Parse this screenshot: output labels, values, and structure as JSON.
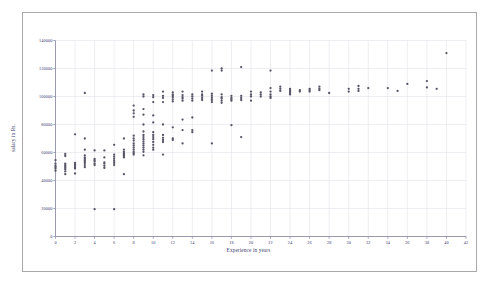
{
  "chart_data": {
    "type": "scatter",
    "title": "",
    "xlabel": "Experience in years",
    "ylabel": "salary in Rs.",
    "xlim": [
      0,
      42
    ],
    "ylim": [
      0,
      140000
    ],
    "xticks": [
      0,
      2,
      4,
      6,
      8,
      10,
      12,
      14,
      16,
      18,
      20,
      22,
      24,
      26,
      28,
      30,
      32,
      34,
      36,
      38,
      40,
      42
    ],
    "yticks": [
      0,
      20000,
      40000,
      60000,
      80000,
      100000,
      120000,
      140000
    ],
    "xtick_labels": [
      "0",
      "2",
      "4",
      "6",
      "8",
      "10",
      "12",
      "14",
      "16",
      "18",
      "20",
      "22",
      "24",
      "26",
      "28",
      "30",
      "32",
      "34",
      "36",
      "38",
      "40",
      "42"
    ],
    "ytick_labels": [
      "0",
      "20000",
      "40000",
      "60000",
      "80000",
      "100000",
      "120000",
      "140000"
    ],
    "grid": true,
    "legend": null,
    "marker_color": "#555566",
    "marker_size": 1.6,
    "points": [
      [
        0,
        52000
      ],
      [
        0,
        50500
      ],
      [
        0,
        49500
      ],
      [
        0,
        48500
      ],
      [
        0,
        47000
      ],
      [
        0,
        54500
      ],
      [
        1,
        59000
      ],
      [
        1,
        57500
      ],
      [
        1,
        52000
      ],
      [
        1,
        51000
      ],
      [
        1,
        50000
      ],
      [
        1,
        49000
      ],
      [
        1,
        48000
      ],
      [
        1,
        46500
      ],
      [
        1,
        44500
      ],
      [
        2,
        73000
      ],
      [
        2,
        52500
      ],
      [
        2,
        51500
      ],
      [
        2,
        50500
      ],
      [
        2,
        49500
      ],
      [
        2,
        48500
      ],
      [
        2,
        45000
      ],
      [
        3,
        102500
      ],
      [
        3,
        70000
      ],
      [
        3,
        62000
      ],
      [
        3,
        58000
      ],
      [
        3,
        56500
      ],
      [
        3,
        55500
      ],
      [
        3,
        54500
      ],
      [
        3,
        53500
      ],
      [
        3,
        52500
      ],
      [
        3,
        51000
      ],
      [
        3,
        49500
      ],
      [
        4,
        61500
      ],
      [
        4,
        55500
      ],
      [
        4,
        54500
      ],
      [
        4,
        53500
      ],
      [
        4,
        52000
      ],
      [
        4,
        51000
      ],
      [
        4,
        19500
      ],
      [
        5,
        61500
      ],
      [
        5,
        56500
      ],
      [
        5,
        53000
      ],
      [
        5,
        52000
      ],
      [
        5,
        50500
      ],
      [
        5,
        49000
      ],
      [
        6,
        65500
      ],
      [
        6,
        58500
      ],
      [
        6,
        57000
      ],
      [
        6,
        55500
      ],
      [
        6,
        54000
      ],
      [
        6,
        52500
      ],
      [
        6,
        51000
      ],
      [
        6,
        19500
      ],
      [
        7,
        70000
      ],
      [
        7,
        62000
      ],
      [
        7,
        60500
      ],
      [
        7,
        59500
      ],
      [
        7,
        58500
      ],
      [
        7,
        57500
      ],
      [
        7,
        56500
      ],
      [
        7,
        44500
      ],
      [
        8,
        93500
      ],
      [
        8,
        90000
      ],
      [
        8,
        88000
      ],
      [
        8,
        85500
      ],
      [
        8,
        72000
      ],
      [
        8,
        70000
      ],
      [
        8,
        68500
      ],
      [
        8,
        66500
      ],
      [
        8,
        65000
      ],
      [
        8,
        63500
      ],
      [
        8,
        62000
      ],
      [
        8,
        60500
      ],
      [
        8,
        59500
      ],
      [
        8,
        58500
      ],
      [
        9,
        101500
      ],
      [
        9,
        100000
      ],
      [
        9,
        91000
      ],
      [
        9,
        87000
      ],
      [
        9,
        80000
      ],
      [
        9,
        75000
      ],
      [
        9,
        72500
      ],
      [
        9,
        71000
      ],
      [
        9,
        69500
      ],
      [
        9,
        68000
      ],
      [
        9,
        66500
      ],
      [
        9,
        65000
      ],
      [
        9,
        63500
      ],
      [
        9,
        62000
      ],
      [
        9,
        60500
      ],
      [
        9,
        58000
      ],
      [
        10,
        101000
      ],
      [
        10,
        99500
      ],
      [
        10,
        96000
      ],
      [
        10,
        86500
      ],
      [
        10,
        81500
      ],
      [
        10,
        74500
      ],
      [
        10,
        72500
      ],
      [
        10,
        71000
      ],
      [
        10,
        69500
      ],
      [
        10,
        67500
      ],
      [
        10,
        65500
      ],
      [
        10,
        63500
      ],
      [
        10,
        62000
      ],
      [
        11,
        103500
      ],
      [
        11,
        100500
      ],
      [
        11,
        99000
      ],
      [
        11,
        96000
      ],
      [
        11,
        80000
      ],
      [
        11,
        72500
      ],
      [
        11,
        70500
      ],
      [
        11,
        69000
      ],
      [
        11,
        67500
      ],
      [
        11,
        58500
      ],
      [
        12,
        103000
      ],
      [
        12,
        101500
      ],
      [
        12,
        100500
      ],
      [
        12,
        99500
      ],
      [
        12,
        98000
      ],
      [
        12,
        96500
      ],
      [
        12,
        78000
      ],
      [
        12,
        70000
      ],
      [
        12,
        69000
      ],
      [
        13,
        103500
      ],
      [
        13,
        101000
      ],
      [
        13,
        99500
      ],
      [
        13,
        98500
      ],
      [
        13,
        97000
      ],
      [
        13,
        83500
      ],
      [
        13,
        76000
      ],
      [
        13,
        66500
      ],
      [
        14,
        101500
      ],
      [
        14,
        100000
      ],
      [
        14,
        98500
      ],
      [
        14,
        97000
      ],
      [
        14,
        85000
      ],
      [
        14,
        76000
      ],
      [
        14,
        74500
      ],
      [
        15,
        103500
      ],
      [
        15,
        101500
      ],
      [
        15,
        100500
      ],
      [
        15,
        99000
      ],
      [
        15,
        97500
      ],
      [
        16,
        118500
      ],
      [
        16,
        102000
      ],
      [
        16,
        100500
      ],
      [
        16,
        99000
      ],
      [
        16,
        97500
      ],
      [
        16,
        96000
      ],
      [
        16,
        66500
      ],
      [
        17,
        120000
      ],
      [
        17,
        118500
      ],
      [
        17,
        101500
      ],
      [
        17,
        99500
      ],
      [
        17,
        98500
      ],
      [
        17,
        97000
      ],
      [
        17,
        95500
      ],
      [
        18,
        100500
      ],
      [
        18,
        99000
      ],
      [
        18,
        98000
      ],
      [
        18,
        97000
      ],
      [
        18,
        79500
      ],
      [
        19,
        121000
      ],
      [
        19,
        100500
      ],
      [
        19,
        99000
      ],
      [
        19,
        97500
      ],
      [
        19,
        71000
      ],
      [
        20,
        103500
      ],
      [
        20,
        101500
      ],
      [
        20,
        100000
      ],
      [
        20,
        97000
      ],
      [
        21,
        103000
      ],
      [
        21,
        101500
      ],
      [
        21,
        100000
      ],
      [
        22,
        118500
      ],
      [
        22,
        106000
      ],
      [
        22,
        103500
      ],
      [
        22,
        101500
      ],
      [
        22,
        100000
      ],
      [
        22,
        99000
      ],
      [
        23,
        107000
      ],
      [
        23,
        105500
      ],
      [
        23,
        104000
      ],
      [
        24,
        105500
      ],
      [
        24,
        104500
      ],
      [
        24,
        103500
      ],
      [
        24,
        102500
      ],
      [
        24,
        101500
      ],
      [
        25,
        104500
      ],
      [
        25,
        103500
      ],
      [
        26,
        105500
      ],
      [
        26,
        104500
      ],
      [
        26,
        103500
      ],
      [
        27,
        107000
      ],
      [
        27,
        105500
      ],
      [
        27,
        104500
      ],
      [
        28,
        102500
      ],
      [
        30,
        105500
      ],
      [
        30,
        103500
      ],
      [
        31,
        107500
      ],
      [
        31,
        105500
      ],
      [
        31,
        104000
      ],
      [
        32,
        106000
      ],
      [
        34,
        106000
      ],
      [
        35,
        104000
      ],
      [
        36,
        109000
      ],
      [
        38,
        111000
      ],
      [
        38,
        106500
      ],
      [
        39,
        105500
      ],
      [
        40,
        131000
      ]
    ]
  },
  "y_axis_title": "salary in Rs.",
  "x_axis_title": "Experience in years"
}
